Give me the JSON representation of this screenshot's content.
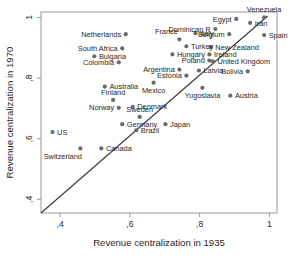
{
  "chart_data": {
    "type": "scatter",
    "title": "",
    "xlabel": "Revenue centralization in 1935",
    "ylabel": "Revenue centralization in 1970",
    "xlim": [
      0.345,
      1.022
    ],
    "ylim": [
      0.355,
      1.018
    ],
    "xticks": [
      0.4,
      0.6,
      0.8,
      1
    ],
    "xticklabels": [
      ",4",
      ",6",
      ",8",
      "1"
    ],
    "yticks": [
      0.4,
      0.6,
      0.8,
      1
    ],
    "yticklabels": [
      ",4",
      ",6",
      ",8",
      "1"
    ],
    "grid": false,
    "legend": false,
    "reference_line": {
      "name": "45-degree-line",
      "x": [
        0.345,
        0.995
      ],
      "y": [
        0.355,
        1.005
      ]
    },
    "marker_color": "#6b6b6b",
    "points": [
      {
        "label": "Venezuela",
        "x": 0.985,
        "y": 1.0,
        "label_pos": "above"
      },
      {
        "label": "Egypt",
        "x": 0.905,
        "y": 0.995,
        "label_pos": "left"
      },
      {
        "label": "Iran",
        "x": 0.945,
        "y": 0.982,
        "label_pos": "right"
      },
      {
        "label": "Dominican R",
        "x": 0.845,
        "y": 0.962,
        "label_pos": "left"
      },
      {
        "label": "Belgium",
        "x": 0.885,
        "y": 0.945,
        "label_pos": "left"
      },
      {
        "label": "Spain",
        "x": 0.985,
        "y": 0.942,
        "label_pos": "right"
      },
      {
        "label": "Italy",
        "x": 0.788,
        "y": 0.948,
        "label_pos": "right"
      },
      {
        "label": "France",
        "x": 0.742,
        "y": 0.928,
        "label_pos": "above-left"
      },
      {
        "label": "Netherlands",
        "x": 0.588,
        "y": 0.945,
        "label_pos": "left"
      },
      {
        "label": "Turkey",
        "x": 0.762,
        "y": 0.905,
        "label_pos": "right"
      },
      {
        "label": "New Zealand",
        "x": 0.832,
        "y": 0.902,
        "label_pos": "right"
      },
      {
        "label": "South Africa",
        "x": 0.578,
        "y": 0.898,
        "label_pos": "left"
      },
      {
        "label": "Hungary",
        "x": 0.722,
        "y": 0.878,
        "label_pos": "right"
      },
      {
        "label": "Ireland",
        "x": 0.828,
        "y": 0.878,
        "label_pos": "right"
      },
      {
        "label": "Bulgaria",
        "x": 0.498,
        "y": 0.872,
        "label_pos": "right"
      },
      {
        "label": "Poland",
        "x": 0.828,
        "y": 0.858,
        "label_pos": "left"
      },
      {
        "label": "United Kingdom",
        "x": 0.838,
        "y": 0.855,
        "label_pos": "right"
      },
      {
        "label": "Colombia",
        "x": 0.568,
        "y": 0.852,
        "label_pos": "left"
      },
      {
        "label": "Argentina",
        "x": 0.742,
        "y": 0.828,
        "label_pos": "left"
      },
      {
        "label": "Latvia",
        "x": 0.798,
        "y": 0.825,
        "label_pos": "right"
      },
      {
        "label": "Bolivia",
        "x": 0.938,
        "y": 0.822,
        "label_pos": "left"
      },
      {
        "label": "Estonia",
        "x": 0.762,
        "y": 0.808,
        "label_pos": "left"
      },
      {
        "label": "Australia",
        "x": 0.528,
        "y": 0.772,
        "label_pos": "right"
      },
      {
        "label": "Mexico",
        "x": 0.668,
        "y": 0.785,
        "label_pos": "below"
      },
      {
        "label": "Yugoslavia",
        "x": 0.808,
        "y": 0.768,
        "label_pos": "below"
      },
      {
        "label": "Austria",
        "x": 0.888,
        "y": 0.742,
        "label_pos": "right"
      },
      {
        "label": "Finland",
        "x": 0.552,
        "y": 0.728,
        "label_pos": "above"
      },
      {
        "label": "Denmark",
        "x": 0.608,
        "y": 0.705,
        "label_pos": "right"
      },
      {
        "label": "Norway",
        "x": 0.568,
        "y": 0.702,
        "label_pos": "left"
      },
      {
        "label": "Sweden",
        "x": 0.628,
        "y": 0.672,
        "label_pos": "above"
      },
      {
        "label": "Germany",
        "x": 0.578,
        "y": 0.648,
        "label_pos": "right"
      },
      {
        "label": "Brazil",
        "x": 0.618,
        "y": 0.628,
        "label_pos": "right"
      },
      {
        "label": "Japan",
        "x": 0.702,
        "y": 0.648,
        "label_pos": "right"
      },
      {
        "label": "US",
        "x": 0.378,
        "y": 0.622,
        "label_pos": "right"
      },
      {
        "label": "Canada",
        "x": 0.518,
        "y": 0.568,
        "label_pos": "right"
      },
      {
        "label": "Switzerland",
        "x": 0.458,
        "y": 0.568,
        "label_pos": "below-left"
      }
    ]
  }
}
